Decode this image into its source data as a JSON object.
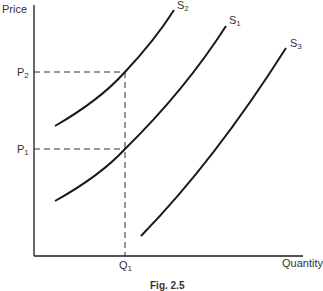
{
  "figure": {
    "caption": "Fig. 2.5",
    "axes": {
      "y_label": "Price",
      "x_label": "Quantity"
    },
    "markers": {
      "P2": {
        "base": "P",
        "sub": "2"
      },
      "P1": {
        "base": "P",
        "sub": "1"
      },
      "Q1": {
        "base": "Q",
        "sub": "1"
      }
    },
    "curves": [
      {
        "id": "S2",
        "base": "S",
        "sub": "2",
        "description": "supply curve shifted left"
      },
      {
        "id": "S1",
        "base": "S",
        "sub": "1",
        "description": "original supply curve"
      },
      {
        "id": "S3",
        "base": "S",
        "sub": "3",
        "description": "supply curve shifted right"
      }
    ],
    "guides": [
      "P2 dashed horizontal to S2 at Q1",
      "P1 dashed horizontal to S1 at Q1",
      "Q1 dashed vertical up to P2"
    ],
    "colors": {
      "line": "#1a1a1a",
      "text": "#333333",
      "background": "#ffffff"
    }
  }
}
